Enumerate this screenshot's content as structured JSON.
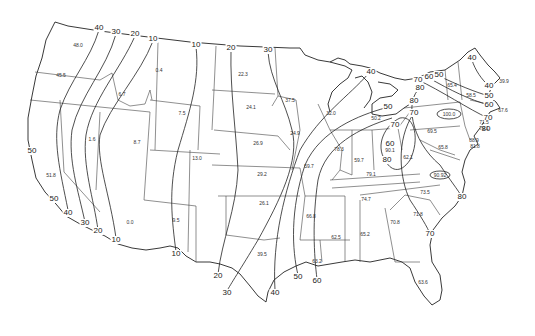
{
  "map": {
    "type": "isoline-map",
    "region": "Contiguous United States",
    "isoline_labels": [
      {
        "id": "iso-nw-40",
        "value": "40",
        "x": 99,
        "y": 28
      },
      {
        "id": "iso-nw-30",
        "value": "30",
        "x": 116,
        "y": 32
      },
      {
        "id": "iso-nw-20",
        "value": "20",
        "x": 135,
        "y": 34
      },
      {
        "id": "iso-nw-10",
        "value": "10",
        "x": 153,
        "y": 39
      },
      {
        "id": "iso-n-10",
        "value": "10",
        "x": 196,
        "y": 45
      },
      {
        "id": "iso-n-20",
        "value": "20",
        "x": 231,
        "y": 48
      },
      {
        "id": "iso-n-30",
        "value": "30",
        "x": 268,
        "y": 50
      },
      {
        "id": "iso-ca-50a",
        "value": "50",
        "x": 32,
        "y": 151
      },
      {
        "id": "iso-ca-50b",
        "value": "50",
        "x": 54,
        "y": 199
      },
      {
        "id": "iso-ca-40",
        "value": "40",
        "x": 68,
        "y": 213
      },
      {
        "id": "iso-sw-30",
        "value": "30",
        "x": 85,
        "y": 223
      },
      {
        "id": "iso-sw-20",
        "value": "20",
        "x": 98,
        "y": 231
      },
      {
        "id": "iso-sw-10",
        "value": "10",
        "x": 116,
        "y": 240
      },
      {
        "id": "iso-tx-10",
        "value": "10",
        "x": 176,
        "y": 254
      },
      {
        "id": "iso-tx-20",
        "value": "20",
        "x": 218,
        "y": 276
      },
      {
        "id": "iso-tx-30",
        "value": "30",
        "x": 227,
        "y": 293
      },
      {
        "id": "iso-gulf-40",
        "value": "40",
        "x": 275,
        "y": 293
      },
      {
        "id": "iso-gulf-50",
        "value": "50",
        "x": 298,
        "y": 277
      },
      {
        "id": "iso-gulf-60",
        "value": "60",
        "x": 317,
        "y": 281
      },
      {
        "id": "iso-mi-40",
        "value": "40",
        "x": 371,
        "y": 72
      },
      {
        "id": "iso-mi-50",
        "value": "50",
        "x": 388,
        "y": 107
      },
      {
        "id": "iso-oh-60",
        "value": "60",
        "x": 390,
        "y": 144
      },
      {
        "id": "iso-oh-80",
        "value": "80",
        "x": 387,
        "y": 160
      },
      {
        "id": "iso-oh-70",
        "value": "70",
        "x": 395,
        "y": 125
      },
      {
        "id": "iso-pa-70",
        "value": "70",
        "x": 418,
        "y": 80
      },
      {
        "id": "iso-pa-60",
        "value": "60",
        "x": 429,
        "y": 77
      },
      {
        "id": "iso-pa-50",
        "value": "50",
        "x": 439,
        "y": 75
      },
      {
        "id": "iso-ny-80",
        "value": "80",
        "x": 420,
        "y": 88
      },
      {
        "id": "iso-ny-80b",
        "value": "80",
        "x": 414,
        "y": 101
      },
      {
        "id": "iso-ny-70",
        "value": "70",
        "x": 414,
        "y": 113
      },
      {
        "id": "iso-ne-40a",
        "value": "40",
        "x": 472,
        "y": 58
      },
      {
        "id": "iso-ne-40b",
        "value": "40",
        "x": 489,
        "y": 86
      },
      {
        "id": "iso-ne-50",
        "value": "50",
        "x": 489,
        "y": 96
      },
      {
        "id": "iso-ne-60",
        "value": "60",
        "x": 489,
        "y": 105
      },
      {
        "id": "iso-ne-70",
        "value": "70",
        "x": 488,
        "y": 118
      },
      {
        "id": "iso-ne-80",
        "value": "80",
        "x": 486,
        "y": 129
      },
      {
        "id": "iso-nc-80",
        "value": "80",
        "x": 462,
        "y": 197
      },
      {
        "id": "iso-sc-70",
        "value": "70",
        "x": 430,
        "y": 234
      }
    ],
    "station_values": [
      {
        "id": "wa",
        "value": "48.0",
        "x": 78,
        "y": 45
      },
      {
        "id": "or",
        "value": "45.5",
        "x": 61,
        "y": 75
      },
      {
        "id": "id-s",
        "value": "6.7",
        "x": 122,
        "y": 94
      },
      {
        "id": "mt",
        "value": "0.4",
        "x": 159,
        "y": 70
      },
      {
        "id": "nv",
        "value": "1.6",
        "x": 92,
        "y": 139
      },
      {
        "id": "ut",
        "value": "8.7",
        "x": 137,
        "y": 142
      },
      {
        "id": "ca",
        "value": "51.8",
        "x": 51,
        "y": 175
      },
      {
        "id": "az",
        "value": "0.0",
        "x": 130,
        "y": 222
      },
      {
        "id": "wy",
        "value": "7.5",
        "x": 182,
        "y": 113
      },
      {
        "id": "co",
        "value": "13.0",
        "x": 197,
        "y": 158
      },
      {
        "id": "nm",
        "value": "9.5",
        "x": 176,
        "y": 220
      },
      {
        "id": "nd",
        "value": "22.3",
        "x": 243,
        "y": 74
      },
      {
        "id": "sd",
        "value": "24.1",
        "x": 251,
        "y": 107
      },
      {
        "id": "mn",
        "value": "37.5",
        "x": 290,
        "y": 100
      },
      {
        "id": "ne",
        "value": "26.9",
        "x": 258,
        "y": 143
      },
      {
        "id": "ia",
        "value": "24.9",
        "x": 295,
        "y": 133
      },
      {
        "id": "ks",
        "value": "29.2",
        "x": 262,
        "y": 174
      },
      {
        "id": "mo",
        "value": "59.7",
        "x": 309,
        "y": 166
      },
      {
        "id": "ok",
        "value": "26.1",
        "x": 264,
        "y": 203
      },
      {
        "id": "tx",
        "value": "39.5",
        "x": 262,
        "y": 254
      },
      {
        "id": "ar",
        "value": "66.8",
        "x": 311,
        "y": 216
      },
      {
        "id": "la",
        "value": "63.2",
        "x": 317,
        "y": 261
      },
      {
        "id": "ms",
        "value": "62.5",
        "x": 336,
        "y": 237
      },
      {
        "id": "al",
        "value": "65.2",
        "x": 365,
        "y": 234
      },
      {
        "id": "wi",
        "value": "32.0",
        "x": 331,
        "y": 113
      },
      {
        "id": "il",
        "value": "78.3",
        "x": 339,
        "y": 149
      },
      {
        "id": "mi",
        "value": "50.2",
        "x": 376,
        "y": 118
      },
      {
        "id": "in",
        "value": "59.7",
        "x": 359,
        "y": 160
      },
      {
        "id": "oh",
        "value": "90.1",
        "x": 390,
        "y": 150
      },
      {
        "id": "ky",
        "value": "79.1",
        "x": 371,
        "y": 174
      },
      {
        "id": "wv",
        "value": "62.1",
        "x": 408,
        "y": 157
      },
      {
        "id": "tn",
        "value": "74.7",
        "x": 366,
        "y": 199
      },
      {
        "id": "pa",
        "value": "69.5",
        "x": 432,
        "y": 131
      },
      {
        "id": "ny",
        "value": "100.0",
        "x": 449,
        "y": 114
      },
      {
        "id": "nc",
        "value": "73.5",
        "x": 425,
        "y": 192
      },
      {
        "id": "sc",
        "value": "71.8",
        "x": 418,
        "y": 214
      },
      {
        "id": "ga",
        "value": "70.8",
        "x": 395,
        "y": 222
      },
      {
        "id": "fl",
        "value": "63.6",
        "x": 423,
        "y": 282
      },
      {
        "id": "va",
        "value": "90.92",
        "x": 440,
        "y": 175
      },
      {
        "id": "md",
        "value": "65.8",
        "x": 443,
        "y": 147
      },
      {
        "id": "de",
        "value": "81.8",
        "x": 475,
        "y": 146
      },
      {
        "id": "nj",
        "value": "88.9",
        "x": 474,
        "y": 140
      },
      {
        "id": "vt",
        "value": "65.4",
        "x": 452,
        "y": 85
      },
      {
        "id": "nh",
        "value": "58.5",
        "x": 471,
        "y": 95
      },
      {
        "id": "me",
        "value": "39.9",
        "x": 504,
        "y": 81
      },
      {
        "id": "ri",
        "value": "67.6",
        "x": 503,
        "y": 110
      },
      {
        "id": "ct",
        "value": "71.5",
        "x": 484,
        "y": 122
      },
      {
        "id": "nyc",
        "value": "79.1",
        "x": 484,
        "y": 128
      }
    ]
  }
}
